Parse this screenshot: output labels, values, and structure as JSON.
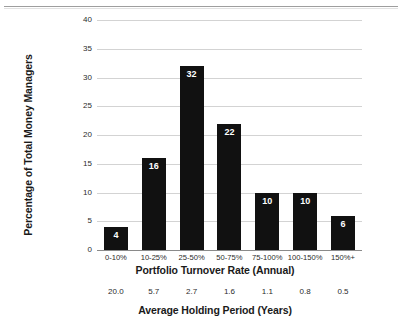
{
  "chart_data": {
    "type": "bar",
    "title": "",
    "categories": [
      "0-10%",
      "10-25%",
      "25-50%",
      "50-75%",
      "75-100%",
      "100-150%",
      "150%+"
    ],
    "values": [
      4,
      16,
      32,
      22,
      10,
      10,
      6
    ],
    "bar_labels": [
      "4",
      "16",
      "32",
      "22",
      "10",
      "10",
      "6"
    ],
    "xlabel": "Portfolio Turnover Rate (Annual)",
    "ylabel": "Percentage of Total Money Managers",
    "ylim": [
      0,
      40
    ],
    "yticks": [
      0,
      5,
      10,
      15,
      20,
      25,
      30,
      35,
      40
    ],
    "ytick_labels": [
      "0",
      "5",
      "10",
      "15",
      "20",
      "25",
      "30",
      "35",
      "40"
    ],
    "grid": true,
    "legend": "none",
    "bar_color": "#111111",
    "bar_label_color": "#ffffff",
    "gridline_color": "#d3d3d3",
    "secondary_axis": {
      "label": "Average Holding Period (Years)",
      "tick_labels": [
        "20.0",
        "5.7",
        "2.7",
        "1.6",
        "1.1",
        "0.8",
        "0.5"
      ]
    }
  }
}
